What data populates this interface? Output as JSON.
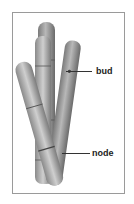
{
  "figure": {
    "labels": [
      {
        "id": "bud",
        "text": "bud"
      },
      {
        "id": "node",
        "text": "node"
      }
    ],
    "colors": {
      "border": "#9a9a9a",
      "cane_light": "#c8c8c8",
      "cane_mid": "#9c9c9c",
      "cane_dark": "#6e6e6e",
      "leader": "#333333",
      "text": "#222222"
    }
  }
}
